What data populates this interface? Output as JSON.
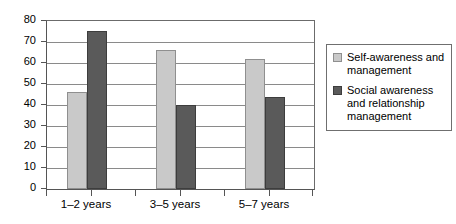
{
  "chart_data": {
    "type": "bar",
    "title": "",
    "xlabel": "",
    "ylabel": "",
    "ylim": [
      0,
      80
    ],
    "ytick_step": 10,
    "yticks": [
      "0",
      "10",
      "20",
      "30",
      "40",
      "50",
      "60",
      "70",
      "80"
    ],
    "grid": true,
    "legend_position": "right",
    "categories": [
      "1–2 years",
      "3–5 years",
      "5–7 years"
    ],
    "series": [
      {
        "name": "Self-awareness and management",
        "color": "#c9c9c9",
        "values": [
          46,
          66,
          62
        ]
      },
      {
        "name": "Social awareness and relationship management",
        "color": "#5a5a5a",
        "values": [
          75,
          40,
          44
        ]
      }
    ]
  },
  "legend": {
    "entries": [
      {
        "label": "Self-awareness and management"
      },
      {
        "label": "Social awareness and relationship management"
      }
    ]
  }
}
